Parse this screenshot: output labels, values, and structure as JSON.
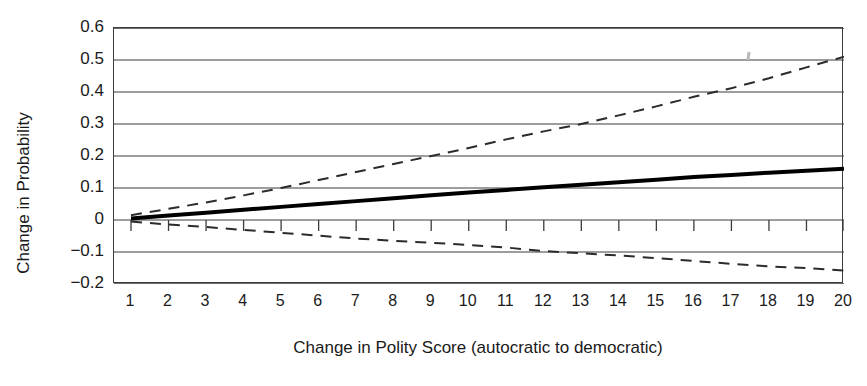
{
  "chart_data": {
    "type": "line",
    "title": "",
    "xlabel": "Change in Polity Score (autocratic to democratic)",
    "ylabel": "Change in Probability",
    "xlim": [
      1,
      20
    ],
    "ylim": [
      -0.2,
      0.6
    ],
    "grid": true,
    "legend": "none",
    "x_tick_labels": [
      "1",
      "2",
      "3",
      "4",
      "5",
      "6",
      "7",
      "8",
      "9",
      "10",
      "11",
      "12",
      "13",
      "14",
      "15",
      "16",
      "17",
      "18",
      "19",
      "20"
    ],
    "y_tick_labels": [
      "0.6",
      "0.5",
      "0.4",
      "0.3",
      "0.2",
      "0.1",
      "0",
      "−0.1",
      "−0.2"
    ],
    "y_tick_values": [
      0.6,
      0.5,
      0.4,
      0.3,
      0.2,
      0.1,
      0.0,
      -0.1,
      -0.2
    ],
    "x": [
      1,
      2,
      3,
      4,
      5,
      6,
      7,
      8,
      9,
      10,
      11,
      12,
      13,
      14,
      15,
      16,
      17,
      18,
      19,
      20
    ],
    "series": [
      {
        "name": "Point estimate",
        "style": "solid",
        "color": "#000000",
        "width": 4,
        "values": [
          0.005,
          0.014,
          0.023,
          0.032,
          0.041,
          0.05,
          0.059,
          0.068,
          0.077,
          0.086,
          0.094,
          0.102,
          0.11,
          0.118,
          0.126,
          0.134,
          0.141,
          0.148,
          0.154,
          0.16
        ]
      },
      {
        "name": "Upper 95% confidence bound",
        "style": "dashed",
        "color": "#2b2b2b",
        "width": 2,
        "values": [
          0.015,
          0.035,
          0.055,
          0.077,
          0.1,
          0.125,
          0.15,
          0.175,
          0.2,
          0.225,
          0.252,
          0.277,
          0.3,
          0.327,
          0.355,
          0.385,
          0.412,
          0.443,
          0.477,
          0.51
        ]
      },
      {
        "name": "Lower 95% confidence bound",
        "style": "dashed",
        "color": "#2b2b2b",
        "width": 2,
        "values": [
          -0.005,
          -0.014,
          -0.022,
          -0.031,
          -0.04,
          -0.049,
          -0.058,
          -0.065,
          -0.071,
          -0.078,
          -0.086,
          -0.097,
          -0.104,
          -0.111,
          -0.119,
          -0.128,
          -0.137,
          -0.145,
          -0.15,
          -0.158
        ]
      }
    ]
  },
  "axes": {
    "ylabel": "Change in Probability",
    "xlabel": "Change in Polity Score (autocratic to democratic)"
  }
}
